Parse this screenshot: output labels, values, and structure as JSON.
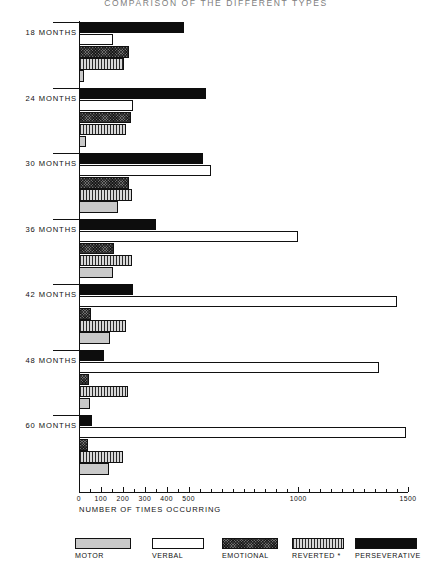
{
  "chart_data": {
    "type": "bar",
    "orientation": "horizontal",
    "title": "COMPARISON OF THE DIFFERENT TYPES",
    "xlabel": "NUMBER OF TIMES OCCURRING",
    "ylabel": "",
    "xlim": [
      0,
      1500
    ],
    "grid": false,
    "legend_position": "bottom",
    "xticks": [
      0,
      100,
      200,
      300,
      400,
      500,
      1000,
      1500
    ],
    "xtick_labels": [
      "0",
      "100",
      "200",
      "300",
      "400",
      "500",
      "1000",
      "1500"
    ],
    "xtick_minor_step": 50,
    "categories": [
      "18 MONTHS",
      "24 MONTHS",
      "30 MONTHS",
      "36 MONTHS",
      "42 MONTHS",
      "48 MONTHS",
      "60 MONTHS"
    ],
    "series": [
      {
        "name": "PERSEVERATIVE",
        "key": "persev",
        "color": "#0d0d0d",
        "fill": "solid-black",
        "values": [
          480,
          580,
          565,
          350,
          245,
          115,
          60
        ]
      },
      {
        "name": "VERBAL",
        "key": "verbal",
        "color": "#ffffff",
        "fill": "white-outline",
        "values": [
          155,
          245,
          600,
          1000,
          1450,
          1370,
          1490
        ]
      },
      {
        "name": "EMOTIONAL",
        "key": "emot",
        "color": "#6e6e6e",
        "fill": "dark-crosshatch",
        "values": [
          230,
          235,
          230,
          160,
          55,
          45,
          40
        ]
      },
      {
        "name": "REVERTED *",
        "key": "rev",
        "color": "#b9b9b9",
        "fill": "vertical-stripes",
        "values": [
          205,
          215,
          240,
          240,
          215,
          225,
          200
        ]
      },
      {
        "name": "MOTOR",
        "key": "motor",
        "color": "#c9c9c9",
        "fill": "light-gray",
        "values": [
          25,
          30,
          180,
          155,
          140,
          50,
          135
        ]
      }
    ],
    "legend_order": [
      "MOTOR",
      "VERBAL",
      "EMOTIONAL",
      "REVERTED *",
      "PERSEVERATIVE"
    ],
    "bar_order_top_to_bottom": [
      "PERSEVERATIVE",
      "VERBAL",
      "EMOTIONAL",
      "REVERTED *",
      "MOTOR"
    ]
  },
  "legend": {
    "items": [
      {
        "label": "MOTOR",
        "key": "motor"
      },
      {
        "label": "VERBAL",
        "key": "verbal"
      },
      {
        "label": "EMOTIONAL",
        "key": "emot"
      },
      {
        "label": "REVERTED *",
        "key": "rev"
      },
      {
        "label": "PERSEVERATIVE",
        "key": "persev"
      }
    ]
  }
}
